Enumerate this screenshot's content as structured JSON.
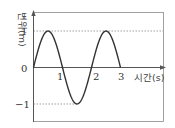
{
  "chart_data": {
    "type": "line",
    "title": "",
    "xlabel": "시간(s)",
    "ylabel": "변위(m)",
    "x_ticks": [
      "1",
      "2",
      "3"
    ],
    "y_ticks": [
      "1",
      "0",
      "−1"
    ],
    "xlim": [
      0,
      3
    ],
    "ylim": [
      -1,
      1
    ],
    "grid": false,
    "legend": null,
    "annotations": [
      "dashed guide lines at y=1 and y=-1"
    ],
    "series": [
      {
        "name": "displacement",
        "function": "sin(pi * t)",
        "x": [
          0,
          0.5,
          1,
          1.5,
          2,
          2.5,
          3
        ],
        "values": [
          0,
          1,
          0,
          -1,
          0,
          1,
          0
        ]
      }
    ]
  }
}
